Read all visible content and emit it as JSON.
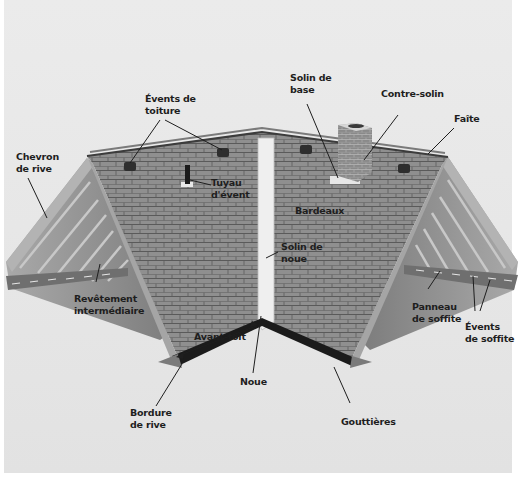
{
  "diagram": {
    "colors": {
      "background": "#e8e8e8",
      "shingle": "#8e8e8e",
      "shingle_line": "#5e5e5e",
      "rafter": "#9a9a9a",
      "flashing": "#ececec",
      "gutter": "#1c1c1c",
      "leader_line": "#1e1e1e",
      "label_text": "#1e1e1e"
    },
    "labels": [
      {
        "id": "chevron-de-rive",
        "text": "Chevron\nde rive"
      },
      {
        "id": "events-de-toiture",
        "text": "Évents de\ntoiture"
      },
      {
        "id": "tuyau-d-event",
        "text": "Tuyau\nd'évent"
      },
      {
        "id": "solin-de-base",
        "text": "Solin de\nbase"
      },
      {
        "id": "contre-solin",
        "text": "Contre-solin"
      },
      {
        "id": "faite",
        "text": "Faîte"
      },
      {
        "id": "bardeaux",
        "text": "Bardeaux"
      },
      {
        "id": "solin-de-noue",
        "text": "Solin de\nnoue"
      },
      {
        "id": "revetement-intermediaire",
        "text": "Revêtement\nintermédiaire"
      },
      {
        "id": "avant-toit",
        "text": "Avant-toit"
      },
      {
        "id": "panneau-de-soffite",
        "text": "Panneau\nde soffite"
      },
      {
        "id": "events-de-soffite",
        "text": "Évents\nde soffite"
      },
      {
        "id": "noue",
        "text": "Noue"
      },
      {
        "id": "bordure-de-rive",
        "text": "Bordure\nde rive"
      },
      {
        "id": "gouttieres",
        "text": "Gouttières"
      }
    ]
  }
}
